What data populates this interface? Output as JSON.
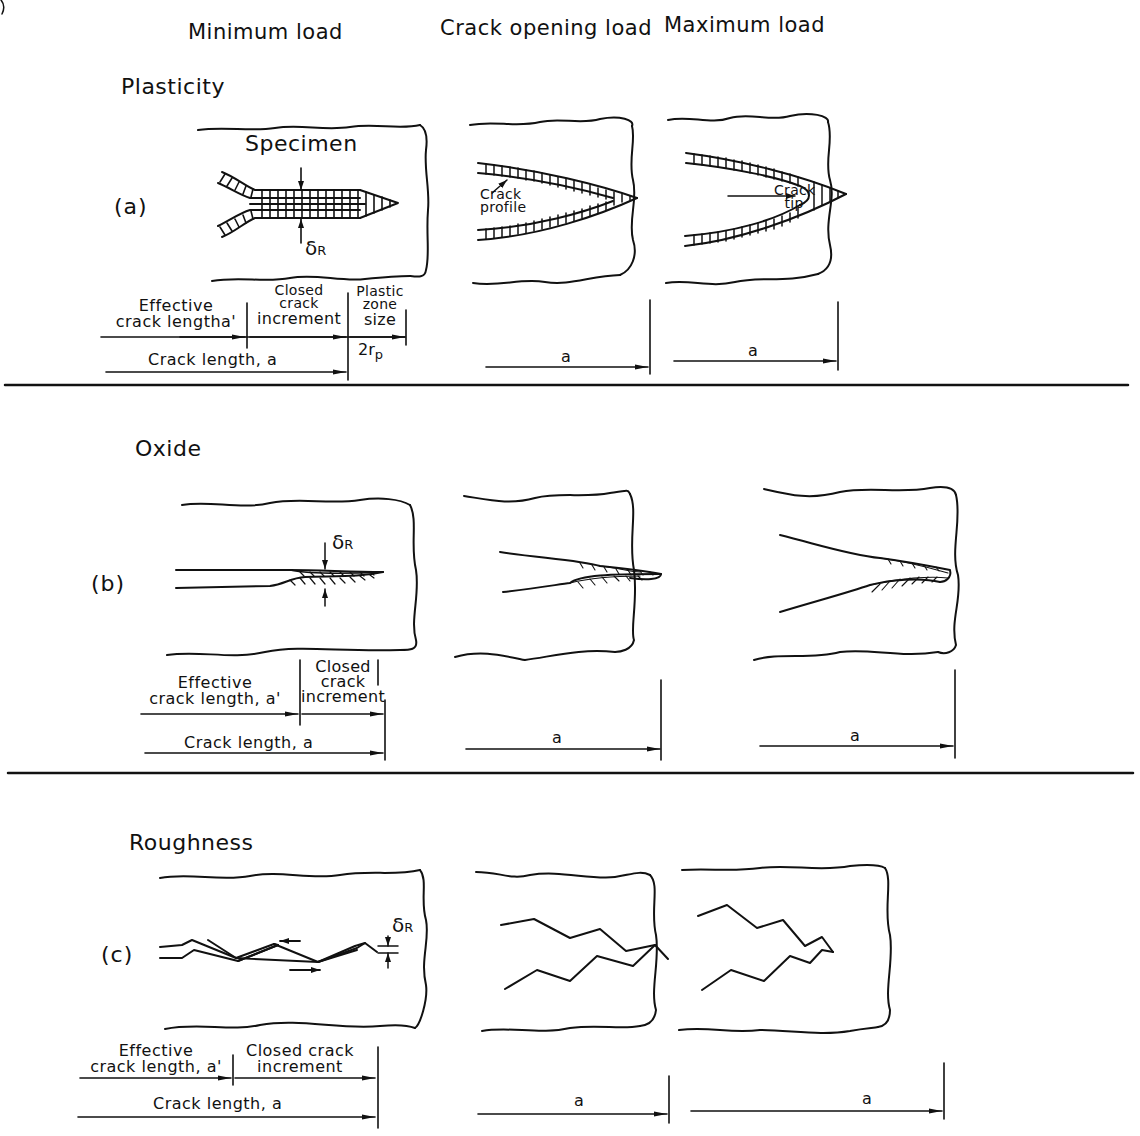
{
  "figure": {
    "columns": [
      "Minimum load",
      "Crack opening load",
      "Maximum load"
    ],
    "sections": [
      {
        "title": "Plasticity",
        "case_label": "(a)",
        "specimen_label": "Specimen",
        "delta_label": "δ",
        "delta_sub": "R",
        "annotations": {
          "crack_profile": "Crack profile",
          "crack_tip": "Crack tip"
        },
        "dimensions": {
          "effective": "Effective crack length a'",
          "effective_line1": "Effective",
          "effective_line2": "crack length",
          "effective_symbol": "a'",
          "closed_line1": "Closed",
          "closed_line2": "crack",
          "closed_line3": "increment",
          "plastic_line1": "Plastic",
          "plastic_line2": "zone",
          "plastic_line3": "size",
          "plastic_symbol": "2r",
          "plastic_sub": "p",
          "crack_length": "Crack length, a",
          "a": "a"
        }
      },
      {
        "title": "Oxide",
        "case_label": "(b)",
        "delta_label": "δ",
        "delta_sub": "R",
        "dimensions": {
          "effective_line1": "Effective",
          "effective_line2": "crack length, a'",
          "closed_line1": "Closed",
          "closed_line2": "crack",
          "closed_line3": "increment",
          "crack_length": "Crack length, a",
          "a": "a"
        }
      },
      {
        "title": "Roughness",
        "case_label": "(c)",
        "delta_label": "δ",
        "delta_sub": "R",
        "dimensions": {
          "effective_line1": "Effective",
          "effective_line2": "crack length, a'",
          "closed_line1": "Closed crack",
          "closed_line2": "increment",
          "crack_length": "Crack length, a",
          "a": "a"
        }
      }
    ]
  }
}
